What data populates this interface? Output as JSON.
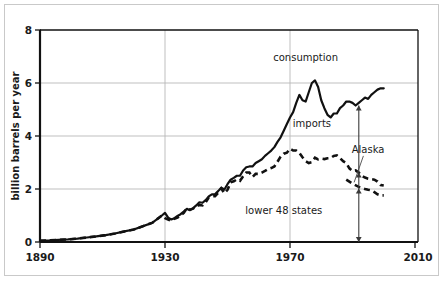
{
  "chart_data": {
    "type": "line",
    "title": "",
    "subtitle": "",
    "xlabel": "",
    "ylabel": "billion barrels per year",
    "xlim": [
      1890,
      2010
    ],
    "ylim": [
      0,
      8
    ],
    "xticks": [
      1890,
      1930,
      1970,
      2010
    ],
    "xtick_labels": [
      "1890",
      "1930",
      "1970",
      "2010"
    ],
    "yticks": [
      0,
      2,
      4,
      6,
      8
    ],
    "ytick_labels": [
      "0",
      "2",
      "4",
      "6",
      "8"
    ],
    "grid": "horizontal-and-vertical-gridlines",
    "legend_position": "in-plot-annotations",
    "annotations": [
      {
        "id": "consumption",
        "text": "consumption",
        "x": 1975,
        "y": 6.85
      },
      {
        "id": "imports",
        "text": "imports",
        "x": 1977,
        "y": 4.35
      },
      {
        "id": "alaska",
        "text": "Alaska",
        "x": 1995,
        "y": 3.37
      },
      {
        "id": "lower-48-states",
        "text": "lower 48 states",
        "x": 1968,
        "y": 1.05
      }
    ],
    "arrow": {
      "id": "production-breakdown-arrow",
      "x": 1992,
      "y_top": 5.15,
      "y_bottom": 0.0,
      "heads": [
        "up-top",
        "mid-upper",
        "mid-lower",
        "down-bottom"
      ]
    },
    "leader_line": {
      "id": "alaska-leader",
      "from_x": 1993.5,
      "from_y": 3.25,
      "to_x": 1990.5,
      "to_y": 2.25
    },
    "series": [
      {
        "name": "consumption",
        "style": "solid",
        "color": "#111111",
        "points": [
          [
            1890,
            0.05
          ],
          [
            1893,
            0.06
          ],
          [
            1896,
            0.08
          ],
          [
            1899,
            0.1
          ],
          [
            1902,
            0.13
          ],
          [
            1905,
            0.17
          ],
          [
            1908,
            0.21
          ],
          [
            1911,
            0.26
          ],
          [
            1914,
            0.32
          ],
          [
            1917,
            0.4
          ],
          [
            1920,
            0.47
          ],
          [
            1923,
            0.6
          ],
          [
            1926,
            0.73
          ],
          [
            1929,
            1.0
          ],
          [
            1930,
            1.1
          ],
          [
            1931,
            0.92
          ],
          [
            1932,
            0.85
          ],
          [
            1933,
            0.9
          ],
          [
            1934,
            0.98
          ],
          [
            1935,
            1.05
          ],
          [
            1936,
            1.15
          ],
          [
            1937,
            1.25
          ],
          [
            1938,
            1.2
          ],
          [
            1939,
            1.28
          ],
          [
            1940,
            1.38
          ],
          [
            1941,
            1.5
          ],
          [
            1942,
            1.48
          ],
          [
            1943,
            1.58
          ],
          [
            1944,
            1.72
          ],
          [
            1945,
            1.8
          ],
          [
            1946,
            1.8
          ],
          [
            1947,
            1.92
          ],
          [
            1948,
            2.05
          ],
          [
            1949,
            1.98
          ],
          [
            1950,
            2.18
          ],
          [
            1951,
            2.35
          ],
          [
            1952,
            2.42
          ],
          [
            1953,
            2.5
          ],
          [
            1954,
            2.5
          ],
          [
            1955,
            2.7
          ],
          [
            1956,
            2.82
          ],
          [
            1957,
            2.85
          ],
          [
            1958,
            2.85
          ],
          [
            1959,
            2.98
          ],
          [
            1960,
            3.05
          ],
          [
            1961,
            3.12
          ],
          [
            1962,
            3.25
          ],
          [
            1963,
            3.35
          ],
          [
            1964,
            3.45
          ],
          [
            1965,
            3.58
          ],
          [
            1966,
            3.78
          ],
          [
            1967,
            3.95
          ],
          [
            1968,
            4.2
          ],
          [
            1969,
            4.45
          ],
          [
            1970,
            4.7
          ],
          [
            1971,
            4.9
          ],
          [
            1972,
            5.25
          ],
          [
            1973,
            5.55
          ],
          [
            1974,
            5.35
          ],
          [
            1975,
            5.3
          ],
          [
            1976,
            5.65
          ],
          [
            1977,
            6.0
          ],
          [
            1978,
            6.1
          ],
          [
            1979,
            5.85
          ],
          [
            1980,
            5.35
          ],
          [
            1981,
            5.05
          ],
          [
            1982,
            4.8
          ],
          [
            1983,
            4.7
          ],
          [
            1984,
            4.85
          ],
          [
            1985,
            4.85
          ],
          [
            1986,
            5.05
          ],
          [
            1987,
            5.15
          ],
          [
            1988,
            5.3
          ],
          [
            1989,
            5.3
          ],
          [
            1990,
            5.25
          ],
          [
            1991,
            5.15
          ],
          [
            1992,
            5.25
          ],
          [
            1993,
            5.35
          ],
          [
            1994,
            5.45
          ],
          [
            1995,
            5.4
          ],
          [
            1996,
            5.55
          ],
          [
            1997,
            5.65
          ],
          [
            1998,
            5.75
          ],
          [
            1999,
            5.8
          ],
          [
            2000,
            5.8
          ]
        ]
      },
      {
        "name": "domestic-production",
        "style": "dashed",
        "color": "#111111",
        "points": [
          [
            1890,
            0.05
          ],
          [
            1893,
            0.06
          ],
          [
            1896,
            0.08
          ],
          [
            1899,
            0.1
          ],
          [
            1902,
            0.13
          ],
          [
            1905,
            0.17
          ],
          [
            1908,
            0.21
          ],
          [
            1911,
            0.26
          ],
          [
            1914,
            0.32
          ],
          [
            1917,
            0.4
          ],
          [
            1920,
            0.47
          ],
          [
            1923,
            0.6
          ],
          [
            1926,
            0.73
          ],
          [
            1929,
            1.0
          ],
          [
            1930,
            0.9
          ],
          [
            1931,
            0.85
          ],
          [
            1932,
            0.8
          ],
          [
            1933,
            0.88
          ],
          [
            1934,
            0.92
          ],
          [
            1935,
            1.0
          ],
          [
            1936,
            1.1
          ],
          [
            1937,
            1.28
          ],
          [
            1938,
            1.22
          ],
          [
            1939,
            1.26
          ],
          [
            1940,
            1.35
          ],
          [
            1941,
            1.4
          ],
          [
            1942,
            1.38
          ],
          [
            1943,
            1.5
          ],
          [
            1944,
            1.68
          ],
          [
            1945,
            1.72
          ],
          [
            1946,
            1.73
          ],
          [
            1947,
            1.85
          ],
          [
            1948,
            2.02
          ],
          [
            1949,
            1.84
          ],
          [
            1950,
            1.97
          ],
          [
            1951,
            2.25
          ],
          [
            1952,
            2.29
          ],
          [
            1953,
            2.36
          ],
          [
            1954,
            2.31
          ],
          [
            1955,
            2.48
          ],
          [
            1956,
            2.62
          ],
          [
            1957,
            2.62
          ],
          [
            1958,
            2.45
          ],
          [
            1959,
            2.57
          ],
          [
            1960,
            2.57
          ],
          [
            1961,
            2.62
          ],
          [
            1962,
            2.68
          ],
          [
            1963,
            2.75
          ],
          [
            1964,
            2.79
          ],
          [
            1965,
            2.85
          ],
          [
            1966,
            3.03
          ],
          [
            1967,
            3.22
          ],
          [
            1968,
            3.33
          ],
          [
            1969,
            3.37
          ],
          [
            1970,
            3.52
          ],
          [
            1971,
            3.45
          ],
          [
            1972,
            3.45
          ],
          [
            1973,
            3.36
          ],
          [
            1974,
            3.2
          ],
          [
            1975,
            3.05
          ],
          [
            1976,
            2.98
          ],
          [
            1977,
            3.01
          ],
          [
            1978,
            3.18
          ],
          [
            1979,
            3.12
          ],
          [
            1980,
            3.15
          ],
          [
            1981,
            3.13
          ],
          [
            1982,
            3.16
          ],
          [
            1983,
            3.17
          ],
          [
            1984,
            3.25
          ],
          [
            1985,
            3.27
          ],
          [
            1986,
            3.17
          ],
          [
            1987,
            3.05
          ],
          [
            1988,
            2.98
          ],
          [
            1989,
            2.78
          ],
          [
            1990,
            2.68
          ],
          [
            1991,
            2.7
          ],
          [
            1992,
            2.62
          ],
          [
            1993,
            2.5
          ],
          [
            1994,
            2.43
          ],
          [
            1995,
            2.39
          ],
          [
            1996,
            2.37
          ],
          [
            1997,
            2.35
          ],
          [
            1998,
            2.28
          ],
          [
            1999,
            2.15
          ],
          [
            2000,
            2.13
          ]
        ]
      },
      {
        "name": "lower-48-states",
        "style": "dashed",
        "color": "#111111",
        "points": [
          [
            1988,
            2.35
          ],
          [
            1990,
            2.2
          ],
          [
            1992,
            2.08
          ],
          [
            1994,
            2.0
          ],
          [
            1995,
            1.97
          ],
          [
            1996,
            1.95
          ],
          [
            1997,
            1.88
          ],
          [
            1998,
            1.8
          ],
          [
            1999,
            1.76
          ],
          [
            2000,
            1.76
          ]
        ]
      }
    ]
  }
}
